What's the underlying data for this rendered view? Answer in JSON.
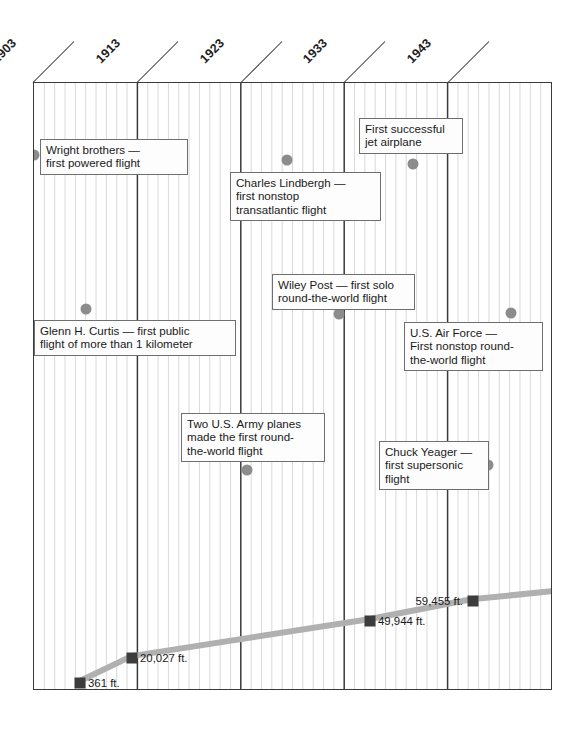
{
  "chart_data": {
    "type": "line",
    "xlabel": "",
    "ylabel": "",
    "xlim": [
      1903,
      1953
    ],
    "grid": true,
    "legend": "none",
    "axis_years": [
      "1903",
      "1913",
      "1923",
      "1933",
      "1943"
    ],
    "series": [
      {
        "name": "Altitude record",
        "unit": "ft.",
        "x": [
          1903,
          1913,
          1933,
          1943,
          1953
        ],
        "values": [
          361,
          20027,
          49944,
          59455,
          62000
        ],
        "labels": [
          "361 ft.",
          "20,027 ft.",
          "49,944 ft.",
          "59,455 ft.",
          ""
        ]
      }
    ],
    "annotations": [
      {
        "id": "wright-brothers",
        "text": "Wright brothers —\nfirst powered flight",
        "year": 1903
      },
      {
        "id": "glenn-curtis",
        "text": "Glenn H. Curtis — first public\nflight of more than 1 kilometer",
        "year": 1908
      },
      {
        "id": "charles-lindbergh",
        "text": "Charles Lindbergh —\nfirst nonstop\ntransatlantic flight",
        "year": 1927
      },
      {
        "id": "two-us-army-planes",
        "text": "Two U.S. Army planes\nmade the first round-\nthe-world flight",
        "year": 1924
      },
      {
        "id": "wiley-post",
        "text": "Wiley Post — first solo\nround-the-world flight",
        "year": 1933
      },
      {
        "id": "first-jet-airplane",
        "text": "First successful\njet airplane",
        "year": 1939
      },
      {
        "id": "us-air-force",
        "text": "U.S. Air Force —\nFirst nonstop round-\nthe-world flight",
        "year": 1949
      },
      {
        "id": "chuck-yeager",
        "text": "Chuck Yeager —\nfirst supersonic\nflight",
        "year": 1947
      }
    ],
    "colors": {
      "frame": "#3a3a3a",
      "gridline": "#d9d9d9",
      "decade_line": "#3a3a3a",
      "event_dot": "#8c8c8c",
      "series_line": "#b0b0b0",
      "series_marker": "#3c3c3c",
      "callout_border": "#6f6f6f",
      "text": "#1a1a1a"
    }
  },
  "axis": {
    "years": [
      {
        "label": "1903"
      },
      {
        "label": "1913"
      },
      {
        "label": "1923"
      },
      {
        "label": "1933"
      },
      {
        "label": "1943"
      }
    ]
  },
  "events": [
    {
      "label": "Wright brothers —\nfirst powered flight"
    },
    {
      "label": "Glenn H. Curtis — first public\nflight of more than 1 kilometer"
    },
    {
      "label": "Charles Lindbergh —\nfirst nonstop\ntransatlantic flight"
    },
    {
      "label": "Two U.S. Army planes\nmade the first round-\nthe-world flight"
    },
    {
      "label": "Wiley Post — first solo\nround-the-world flight"
    },
    {
      "label": "First successful\njet airplane"
    },
    {
      "label": "U.S. Air Force —\nFirst nonstop round-\nthe-world flight"
    },
    {
      "label": "Chuck Yeager —\nfirst supersonic\nflight"
    }
  ],
  "altitudes": [
    {
      "label": "361 ft."
    },
    {
      "label": "20,027 ft."
    },
    {
      "label": "49,944 ft."
    },
    {
      "label": "59,455 ft."
    }
  ]
}
